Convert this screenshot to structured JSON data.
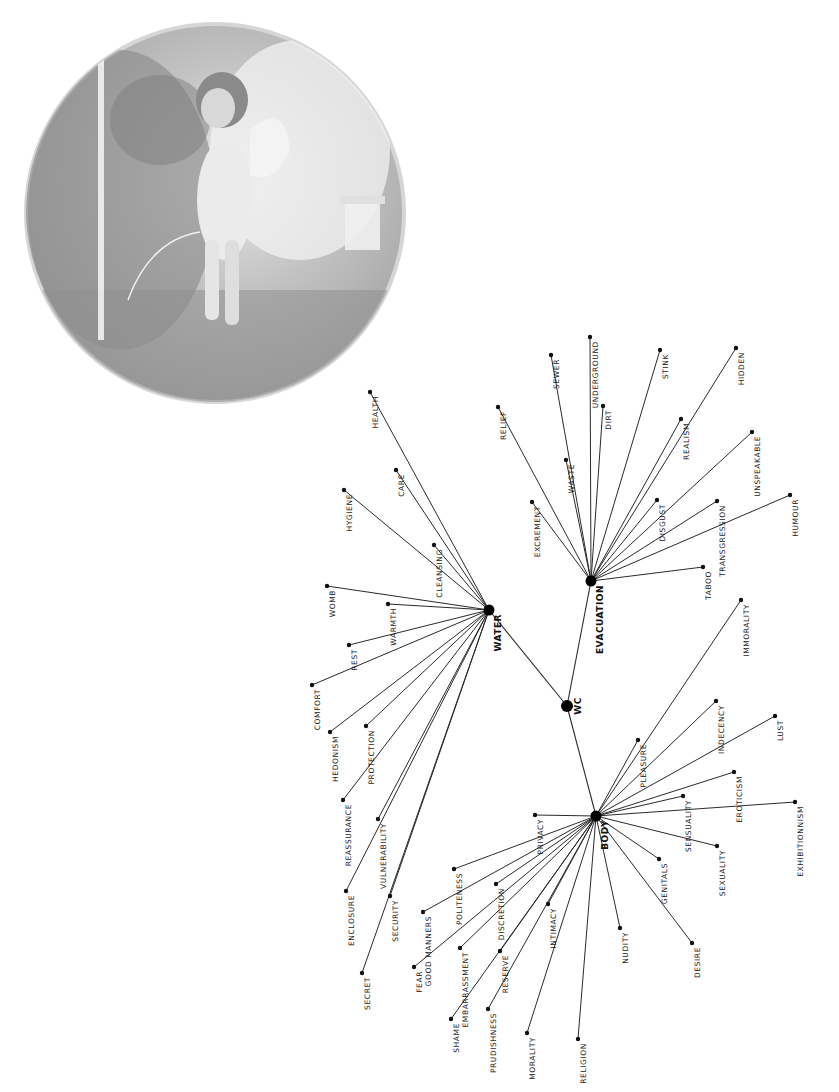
{
  "image": {
    "name": "medallion-illustration",
    "description": "grey-toned circular medallion painting of a winged cherub urinating in a garden"
  },
  "diagram": {
    "root": {
      "id": "wc",
      "label": "WC",
      "x": 567,
      "y": 706
    },
    "hubs": [
      {
        "id": "water",
        "label": "WATER",
        "x": 489,
        "y": 610
      },
      {
        "id": "evacuation",
        "label": "EVACUATION",
        "x": 591,
        "y": 581
      },
      {
        "id": "body",
        "label": "BODY",
        "x": 596,
        "y": 816
      }
    ],
    "leaves": [
      {
        "hub": "water",
        "label": "HEALTH",
        "x": 370,
        "y": 392
      },
      {
        "hub": "water",
        "label": "CARE",
        "x": 396,
        "y": 470
      },
      {
        "hub": "water",
        "label": "HYGIENE",
        "x": 344,
        "y": 490
      },
      {
        "hub": "water",
        "label": "CLEANSING",
        "x": 434,
        "y": 545
      },
      {
        "hub": "water",
        "label": "WOMB",
        "x": 327,
        "y": 586
      },
      {
        "hub": "water",
        "label": "WARMTH",
        "x": 388,
        "y": 604
      },
      {
        "hub": "water",
        "label": "REST",
        "x": 349,
        "y": 645
      },
      {
        "hub": "water",
        "label": "COMFORT",
        "x": 312,
        "y": 685
      },
      {
        "hub": "water",
        "label": "HEDONISM",
        "x": 330,
        "y": 732
      },
      {
        "hub": "water",
        "label": "PROTECTION",
        "x": 366,
        "y": 726
      },
      {
        "hub": "water",
        "label": "REASSURANCE",
        "x": 343,
        "y": 800
      },
      {
        "hub": "water",
        "label": "VULNERABILITY",
        "x": 378,
        "y": 819
      },
      {
        "hub": "water",
        "label": "ENCLOSURE",
        "x": 346,
        "y": 891
      },
      {
        "hub": "water",
        "label": "SECURITY",
        "x": 390,
        "y": 896
      },
      {
        "hub": "water",
        "label": "SECRET",
        "x": 362,
        "y": 973
      },
      {
        "hub": "evacuation",
        "label": "RELIEF",
        "x": 498,
        "y": 407
      },
      {
        "hub": "evacuation",
        "label": "SEWER",
        "x": 551,
        "y": 355
      },
      {
        "hub": "evacuation",
        "label": "UNDERGROUND",
        "x": 590,
        "y": 337
      },
      {
        "hub": "evacuation",
        "label": "STINK",
        "x": 660,
        "y": 350
      },
      {
        "hub": "evacuation",
        "label": "DIRT",
        "x": 603,
        "y": 406
      },
      {
        "hub": "evacuation",
        "label": "HIDDEN",
        "x": 736,
        "y": 348
      },
      {
        "hub": "evacuation",
        "label": "WASTE",
        "x": 566,
        "y": 460
      },
      {
        "hub": "evacuation",
        "label": "REALISM",
        "x": 681,
        "y": 419
      },
      {
        "hub": "evacuation",
        "label": "EXCREMENT",
        "x": 532,
        "y": 502
      },
      {
        "hub": "evacuation",
        "label": "UNSPEAKABLE",
        "x": 752,
        "y": 432
      },
      {
        "hub": "evacuation",
        "label": "DISGUST",
        "x": 657,
        "y": 500
      },
      {
        "hub": "evacuation",
        "label": "TRANSGRESSION",
        "x": 717,
        "y": 501
      },
      {
        "hub": "evacuation",
        "label": "HUMOUR",
        "x": 790,
        "y": 495
      },
      {
        "hub": "evacuation",
        "label": "TABOO",
        "x": 703,
        "y": 567
      },
      {
        "hub": "body",
        "label": "IMMORALITY",
        "x": 741,
        "y": 600
      },
      {
        "hub": "body",
        "label": "PLEASURE",
        "x": 638,
        "y": 740
      },
      {
        "hub": "body",
        "label": "INDECENCY",
        "x": 716,
        "y": 701
      },
      {
        "hub": "body",
        "label": "LUST",
        "x": 775,
        "y": 716
      },
      {
        "hub": "body",
        "label": "EROTICISM",
        "x": 734,
        "y": 772
      },
      {
        "hub": "body",
        "label": "SENSUALITY",
        "x": 683,
        "y": 796
      },
      {
        "hub": "body",
        "label": "EXHIBITIONNISM",
        "x": 795,
        "y": 802
      },
      {
        "hub": "body",
        "label": "SEXUALITY",
        "x": 717,
        "y": 846
      },
      {
        "hub": "body",
        "label": "GENITALS",
        "x": 659,
        "y": 859
      },
      {
        "hub": "body",
        "label": "DESIRE",
        "x": 692,
        "y": 943
      },
      {
        "hub": "body",
        "label": "NUDITY",
        "x": 620,
        "y": 928
      },
      {
        "hub": "body",
        "label": "PRIVACY",
        "x": 535,
        "y": 815
      },
      {
        "hub": "body",
        "label": "POLITENESS",
        "x": 454,
        "y": 869
      },
      {
        "hub": "body",
        "label": "DISCRETION",
        "x": 496,
        "y": 884
      },
      {
        "hub": "body",
        "label": "GOOD MANNERS",
        "x": 423,
        "y": 912
      },
      {
        "hub": "body",
        "label": "INTIMACY",
        "x": 548,
        "y": 904
      },
      {
        "hub": "body",
        "label": "EMBARRASSMENT",
        "x": 460,
        "y": 948
      },
      {
        "hub": "body",
        "label": "RESERVE",
        "x": 500,
        "y": 951
      },
      {
        "hub": "body",
        "label": "FEAR",
        "x": 414,
        "y": 967
      },
      {
        "hub": "body",
        "label": "PRUDISHNESS",
        "x": 488,
        "y": 1009
      },
      {
        "hub": "body",
        "label": "SHAME",
        "x": 451,
        "y": 1019
      },
      {
        "hub": "body",
        "label": "MORALITY",
        "x": 527,
        "y": 1033
      },
      {
        "hub": "body",
        "label": "RELIGION",
        "x": 578,
        "y": 1039
      }
    ]
  }
}
